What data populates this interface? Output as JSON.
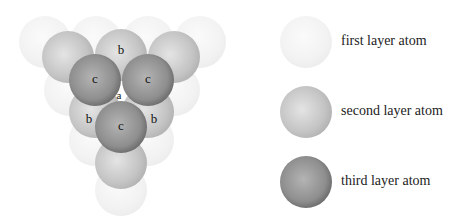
{
  "diagram": {
    "layers": {
      "first": [
        {
          "x": 45,
          "y": 42
        },
        {
          "x": 96,
          "y": 42
        },
        {
          "x": 148,
          "y": 42
        },
        {
          "x": 200,
          "y": 42
        },
        {
          "x": 70,
          "y": 90
        },
        {
          "x": 174,
          "y": 90
        },
        {
          "x": 95,
          "y": 140
        },
        {
          "x": 148,
          "y": 140
        },
        {
          "x": 121,
          "y": 190
        }
      ],
      "second": [
        {
          "x": 68,
          "y": 57
        },
        {
          "x": 121,
          "y": 55,
          "label": "b"
        },
        {
          "x": 174,
          "y": 57
        },
        {
          "x": 95,
          "y": 112,
          "label": "b"
        },
        {
          "x": 148,
          "y": 112,
          "label": "b"
        },
        {
          "x": 121,
          "y": 163
        }
      ],
      "third": [
        {
          "x": 95,
          "y": 80,
          "label": "c"
        },
        {
          "x": 148,
          "y": 80,
          "label": "c"
        },
        {
          "x": 121,
          "y": 127,
          "label": "c"
        }
      ]
    },
    "center_label": "a",
    "radius": 26
  },
  "legend": {
    "items": [
      {
        "label": "first layer atom",
        "layer": "first"
      },
      {
        "label": "second layer atom",
        "layer": "second"
      },
      {
        "label": "third layer atom",
        "layer": "third"
      }
    ]
  }
}
